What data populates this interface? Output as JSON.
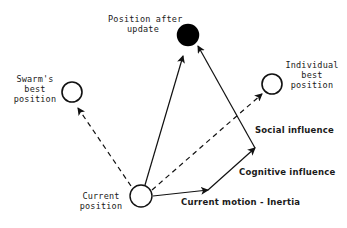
{
  "diagram": {
    "nodes": {
      "after_update": {
        "label_line1": "Position after",
        "label_line2": "update",
        "fill": "#000000"
      },
      "swarm_best": {
        "label_line1": "Swarm's",
        "label_line2": "best",
        "label_line3": "position",
        "fill": "#ffffff"
      },
      "individual_best": {
        "label_line1": "Individual",
        "label_line2": "best",
        "label_line3": "position",
        "fill": "#ffffff"
      },
      "current": {
        "label_line1": "Current",
        "label_line2": "position",
        "fill": "#ffffff"
      }
    },
    "edges": {
      "inertia": "Current motion - Inertia",
      "cognitive": "Cognitive influence",
      "social": "Social influence"
    },
    "colors": {
      "stroke": "#111111",
      "background": "#ffffff"
    }
  }
}
